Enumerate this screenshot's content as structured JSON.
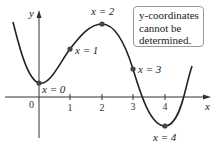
{
  "diagram": {
    "axes": {
      "x_label": "x",
      "y_label": "y"
    },
    "ticks": [
      {
        "label": "0",
        "x": 0
      },
      {
        "label": "1",
        "x": 1
      },
      {
        "label": "2",
        "x": 2
      },
      {
        "label": "3",
        "x": 3
      },
      {
        "label": "4",
        "x": 4
      }
    ],
    "points": [
      {
        "label": "x = 0"
      },
      {
        "label": "x = 1"
      },
      {
        "label": "x = 2"
      },
      {
        "label": "x = 3"
      },
      {
        "label": "x = 4"
      }
    ],
    "callout": {
      "lines": [
        "y-coordinates",
        "cannot be",
        "determined."
      ]
    },
    "colors": {
      "curve": "#222222",
      "axis": "#333333",
      "point": "#444444"
    }
  }
}
